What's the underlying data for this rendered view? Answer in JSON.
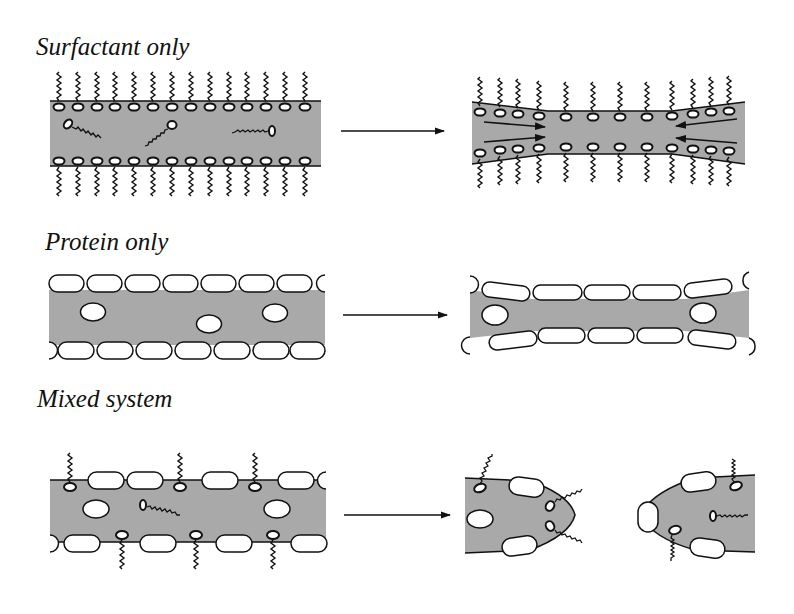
{
  "figure": {
    "type": "schematic",
    "colors": {
      "film_fill": "#a9a9a9",
      "outline": "#111111",
      "background": "#ffffff",
      "protein_fill": "#ffffff"
    },
    "panels": [
      {
        "id": "surfactant",
        "label": "Surfactant only",
        "before": "flat film lined with surfactant head groups and tails; free surfactant molecules inside",
        "after": "film thins in the middle; Marangoni flow arrows point toward thinned region",
        "arrow": "right-arrow"
      },
      {
        "id": "protein",
        "label": "Protein only",
        "before": "flat film lined with rounded protein molecules; protein aggregates inside",
        "after": "film stretches and thins in the middle; protein layer remains continuous",
        "arrow": "right-arrow"
      },
      {
        "id": "mixed",
        "label": "Mixed system",
        "before": "film lined with mixed protein molecules and surfactants",
        "after": "film ruptures into two lobes",
        "arrow": "right-arrow"
      }
    ]
  }
}
